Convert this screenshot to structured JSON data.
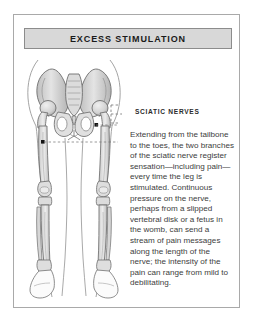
{
  "panel": {
    "title": "EXCESS STIMULATION",
    "border_color": "#a9a9a9",
    "title_bg_color": "#d8d8d8",
    "title_border_color": "#8c8c8c",
    "background_color": "#ffffff"
  },
  "illustration": {
    "name": "skeletal-legs-and-pelvis-anterior-view",
    "description": "Anterior view of human pelvis, femurs, knees, tibiae, fibulae and feet with body outline",
    "bone_fill": "#d9d9d9",
    "bone_outline": "#6e6e6e",
    "body_outline": "#9a9a9a",
    "nerve_marker_color": "#1a1a1a"
  },
  "callout": {
    "label": "SCIATIC NERVES",
    "leader_style": "dashed-bracket",
    "leader_color": "#7a7a7a"
  },
  "body": {
    "paragraph": "Extending from the tailbone to the toes, the two branches of the sciatic nerve register sensation—including pain—every time the leg is stimulated. Continuous pressure on the nerve, perhaps from a slipped vertebral disk or a fetus in the womb, can send a stream of pain messages along the length of the nerve; the intensity of the pain can range from mild to debilitating.",
    "text_color": "#3d3d3d"
  }
}
